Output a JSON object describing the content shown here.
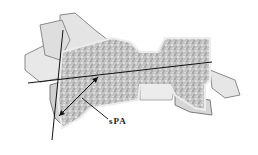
{
  "figure": {
    "annotation_label": "sPA",
    "colors": {
      "bone_fill": "#c8c8c8",
      "bone_outline": "#6a6a6a",
      "cortical": "#ececec",
      "line": "#111111"
    }
  }
}
